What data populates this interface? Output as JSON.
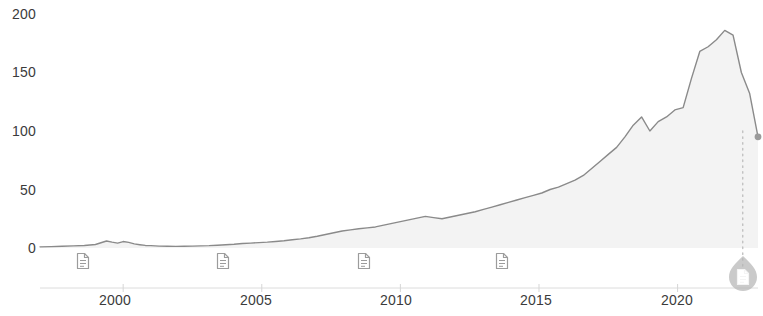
{
  "chart_data": {
    "type": "line",
    "title": "",
    "xlabel": "",
    "ylabel": "",
    "xlim": [
      1997.0,
      2022.9
    ],
    "ylim": [
      0,
      200
    ],
    "grid": false,
    "legend": null,
    "y_ticks": [
      0,
      50,
      100,
      150,
      200
    ],
    "y_tick_labels": [
      "0",
      "50",
      "100",
      "150",
      "200"
    ],
    "x_ticks": [
      2000,
      2005,
      2010,
      2015,
      2020
    ],
    "x_tick_labels": [
      "2000",
      "2005",
      "2010",
      "2015",
      "2020"
    ],
    "series": [
      {
        "name": "price",
        "color": "#8a8a8a",
        "x": [
          1997.0,
          1997.4,
          1997.8,
          1998.2,
          1998.6,
          1999.0,
          1999.2,
          1999.4,
          1999.6,
          1999.8,
          2000.0,
          2000.2,
          2000.4,
          2000.6,
          2000.8,
          2001.0,
          2001.3,
          2001.6,
          2001.9,
          2002.2,
          2002.5,
          2002.8,
          2003.1,
          2003.4,
          2003.7,
          2004.0,
          2004.3,
          2004.6,
          2004.9,
          2005.2,
          2005.5,
          2005.8,
          2006.1,
          2006.4,
          2006.7,
          2007.0,
          2007.3,
          2007.6,
          2007.9,
          2008.2,
          2008.5,
          2008.8,
          2009.1,
          2009.4,
          2009.7,
          2010.0,
          2010.3,
          2010.6,
          2010.9,
          2011.2,
          2011.5,
          2011.8,
          2012.1,
          2012.4,
          2012.7,
          2013.0,
          2013.3,
          2013.6,
          2013.9,
          2014.2,
          2014.5,
          2014.8,
          2015.1,
          2015.4,
          2015.7,
          2016.0,
          2016.3,
          2016.6,
          2016.9,
          2017.2,
          2017.5,
          2017.8,
          2018.1,
          2018.4,
          2018.7,
          2019.0,
          2019.3,
          2019.6,
          2019.9,
          2020.2,
          2020.5,
          2020.8,
          2021.1,
          2021.4,
          2021.7,
          2022.0,
          2022.3,
          2022.6,
          2022.9
        ],
        "y": [
          1.0,
          1.2,
          1.5,
          1.8,
          2.2,
          3.0,
          4.5,
          6.0,
          5.0,
          4.2,
          5.5,
          4.8,
          3.5,
          2.8,
          2.2,
          2.0,
          1.6,
          1.5,
          1.4,
          1.5,
          1.6,
          1.8,
          2.0,
          2.4,
          2.8,
          3.2,
          3.8,
          4.2,
          4.6,
          5.0,
          5.6,
          6.2,
          7.0,
          7.8,
          8.8,
          10.0,
          11.5,
          13.0,
          14.5,
          15.5,
          16.5,
          17.2,
          18.0,
          19.5,
          21.0,
          22.5,
          24.0,
          25.5,
          27.0,
          26.0,
          25.0,
          26.5,
          28.0,
          29.5,
          31.0,
          33.0,
          35.0,
          37.0,
          39.0,
          41.0,
          43.0,
          45.0,
          47.0,
          50.0,
          52.0,
          55.0,
          58.0,
          62.0,
          68.0,
          74.0,
          80.0,
          86.0,
          95.0,
          105.0,
          112.0,
          100.0,
          108.0,
          112.0,
          118.0,
          120.0,
          145.0,
          168.0,
          172.0,
          178.0,
          186.0,
          182.0,
          150.0,
          132.0,
          95.0
        ]
      }
    ],
    "annotations": {
      "vertical_dotted_line": {
        "x": 2022.35,
        "y_top": 100,
        "y_bottom": 0,
        "color": "#bdbdbd"
      },
      "end_point": {
        "x": 2022.9,
        "y": 95,
        "color": "#9a9a9a"
      },
      "document_markers": [
        {
          "x": 1998.55,
          "y": -11,
          "label": "document-marker-1"
        },
        {
          "x": 2003.6,
          "y": -11,
          "label": "document-marker-2"
        },
        {
          "x": 2008.7,
          "y": -11,
          "label": "document-marker-3"
        },
        {
          "x": 2013.65,
          "y": -11,
          "label": "document-marker-4"
        }
      ],
      "highlighted_document_marker": {
        "x": 2022.35,
        "y": -22,
        "label": "document-marker-selected"
      }
    },
    "colors": {
      "line": "#8a8a8a",
      "axis": "#d6d6d6",
      "tick_text": "#3b3b3b",
      "dotted_guide": "#bdbdbd",
      "marker_fill": "#9c9c9c",
      "marker_highlight_ring": "#b5b5b5",
      "background": "#ffffff"
    }
  }
}
